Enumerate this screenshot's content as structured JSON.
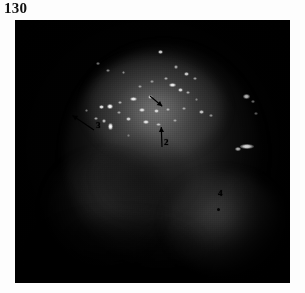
{
  "page": {
    "folio": "130",
    "figure_caption": ""
  },
  "figure": {
    "name": "endoscopic-fluorescence-photograph",
    "background_color": "#000000",
    "plate": {
      "left": 15,
      "top": 20,
      "width": 275,
      "height": 263
    },
    "annotations": [
      {
        "id": "1",
        "label": "1",
        "type": "arrow",
        "x": 150,
        "y": 96,
        "angle": 40,
        "length": 16,
        "label_visible": false
      },
      {
        "id": "2",
        "label": "2",
        "type": "arrow",
        "x": 162,
        "y": 147,
        "angle": 268,
        "length": 20,
        "label_visible": true
      },
      {
        "id": "3",
        "label": "3",
        "type": "arrow",
        "x": 94,
        "y": 130,
        "angle": 214,
        "length": 26,
        "label_visible": true
      },
      {
        "id": "4",
        "label": "4",
        "type": "dot",
        "x": 216,
        "y": 198,
        "label_visible": true
      }
    ],
    "specks": [
      {
        "x": 160,
        "y": 52,
        "w": 5,
        "h": 4,
        "o": 0.95
      },
      {
        "x": 98,
        "y": 63,
        "w": 4,
        "h": 3,
        "o": 0.55
      },
      {
        "x": 108,
        "y": 70,
        "w": 4,
        "h": 3,
        "o": 0.5
      },
      {
        "x": 123,
        "y": 72,
        "w": 3,
        "h": 3,
        "o": 0.45
      },
      {
        "x": 176,
        "y": 67,
        "w": 4,
        "h": 4,
        "o": 0.6
      },
      {
        "x": 186,
        "y": 74,
        "w": 5,
        "h": 4,
        "o": 0.8
      },
      {
        "x": 195,
        "y": 78,
        "w": 4,
        "h": 3,
        "o": 0.55
      },
      {
        "x": 166,
        "y": 78,
        "w": 4,
        "h": 3,
        "o": 0.6
      },
      {
        "x": 152,
        "y": 81,
        "w": 4,
        "h": 3,
        "o": 0.5
      },
      {
        "x": 140,
        "y": 86,
        "w": 4,
        "h": 3,
        "o": 0.5
      },
      {
        "x": 172,
        "y": 85,
        "w": 7,
        "h": 4,
        "o": 0.95
      },
      {
        "x": 180,
        "y": 90,
        "w": 5,
        "h": 4,
        "o": 0.85
      },
      {
        "x": 188,
        "y": 92,
        "w": 4,
        "h": 3,
        "o": 0.6
      },
      {
        "x": 150,
        "y": 97,
        "w": 5,
        "h": 4,
        "o": 0.75
      },
      {
        "x": 133,
        "y": 99,
        "w": 7,
        "h": 4,
        "o": 0.95
      },
      {
        "x": 120,
        "y": 102,
        "w": 4,
        "h": 3,
        "o": 0.6
      },
      {
        "x": 110,
        "y": 106,
        "w": 6,
        "h": 5,
        "o": 1.0
      },
      {
        "x": 101,
        "y": 107,
        "w": 5,
        "h": 4,
        "o": 0.9
      },
      {
        "x": 119,
        "y": 112,
        "w": 4,
        "h": 3,
        "o": 0.55
      },
      {
        "x": 142,
        "y": 110,
        "w": 6,
        "h": 4,
        "o": 0.85
      },
      {
        "x": 156,
        "y": 111,
        "w": 5,
        "h": 4,
        "o": 0.8
      },
      {
        "x": 168,
        "y": 109,
        "w": 4,
        "h": 3,
        "o": 0.6
      },
      {
        "x": 184,
        "y": 108,
        "w": 4,
        "h": 3,
        "o": 0.55
      },
      {
        "x": 201,
        "y": 112,
        "w": 5,
        "h": 4,
        "o": 0.75
      },
      {
        "x": 211,
        "y": 115,
        "w": 4,
        "h": 3,
        "o": 0.5
      },
      {
        "x": 128,
        "y": 119,
        "w": 5,
        "h": 4,
        "o": 0.8
      },
      {
        "x": 146,
        "y": 122,
        "w": 6,
        "h": 4,
        "o": 0.9
      },
      {
        "x": 158,
        "y": 124,
        "w": 5,
        "h": 3,
        "o": 0.65
      },
      {
        "x": 110,
        "y": 126,
        "w": 5,
        "h": 7,
        "o": 1.0
      },
      {
        "x": 104,
        "y": 121,
        "w": 4,
        "h": 4,
        "o": 0.7
      },
      {
        "x": 96,
        "y": 118,
        "w": 4,
        "h": 3,
        "o": 0.6
      },
      {
        "x": 175,
        "y": 120,
        "w": 4,
        "h": 3,
        "o": 0.5
      },
      {
        "x": 246,
        "y": 96,
        "w": 7,
        "h": 5,
        "o": 0.95
      },
      {
        "x": 253,
        "y": 101,
        "w": 4,
        "h": 3,
        "o": 0.6
      },
      {
        "x": 256,
        "y": 113,
        "w": 4,
        "h": 3,
        "o": 0.5
      },
      {
        "x": 247,
        "y": 146,
        "w": 14,
        "h": 5,
        "o": 0.95
      },
      {
        "x": 238,
        "y": 149,
        "w": 6,
        "h": 4,
        "o": 0.7
      },
      {
        "x": 86,
        "y": 110,
        "w": 3,
        "h": 3,
        "o": 0.4
      },
      {
        "x": 128,
        "y": 135,
        "w": 3,
        "h": 3,
        "o": 0.35
      },
      {
        "x": 196,
        "y": 99,
        "w": 3,
        "h": 3,
        "o": 0.4
      }
    ]
  }
}
